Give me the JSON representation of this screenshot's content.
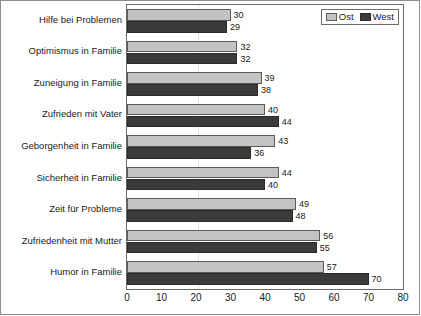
{
  "chart_data": {
    "type": "bar",
    "orientation": "horizontal",
    "title": "",
    "subtitle": "",
    "xlabel": "",
    "ylabel": "",
    "xlim": [
      0,
      80
    ],
    "xticks": [
      0,
      10,
      20,
      30,
      40,
      50,
      60,
      70,
      80
    ],
    "xtick_labels": [
      "0",
      "10",
      "20",
      "30",
      "40",
      "50",
      "60",
      "70",
      "80"
    ],
    "grid": true,
    "legend_position": "top-right",
    "categories": [
      "Hilfe bei Problemen",
      "Optimismus in Familie",
      "Zuneigung in Familie",
      "Zufrieden mit Vater",
      "Geborgenheit in Familie",
      "Sicherheit in Familie",
      "Zeit für Probleme",
      "Zufriedenheit mit Mutter",
      "Humor in Familie"
    ],
    "series": [
      {
        "name": "Ost",
        "color": "#c3c3c3",
        "values": [
          30,
          32,
          39,
          40,
          43,
          44,
          49,
          56,
          57
        ],
        "labels": [
          "30",
          "32",
          "39",
          "40",
          "43",
          "44",
          "49",
          "56",
          "57"
        ]
      },
      {
        "name": "West",
        "color": "#3b3b3b",
        "values": [
          29,
          32,
          38,
          44,
          36,
          40,
          48,
          55,
          70
        ],
        "labels": [
          "29",
          "32",
          "38",
          "44",
          "36",
          "40",
          "48",
          "55",
          "70"
        ]
      }
    ]
  },
  "legend": {
    "entries": [
      {
        "label": "Ost",
        "swatch": "legend-swatch-ost"
      },
      {
        "label": "West",
        "swatch": "legend-swatch-west"
      }
    ]
  }
}
